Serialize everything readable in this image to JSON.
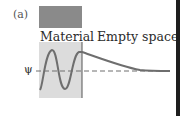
{
  "figure": {
    "panel_label": "(a)",
    "regions": [
      {
        "label": "Material",
        "fill": "#dcdcdc",
        "bar_fill": "#8a8a8a"
      },
      {
        "label": "Empty space",
        "fill": "#ffffff"
      }
    ],
    "axis_label": "ψ",
    "wave": {
      "inside": "oscillating sinusoid (~1.5 periods)",
      "outside": "exponential decay to axis",
      "color": "#6e6e6e"
    },
    "axis_style": "dashed",
    "colors": {
      "material_bar": "#8a8a8a",
      "material_region": "#dcdcdc",
      "curve": "#6e6e6e",
      "boundary": "#555555",
      "border": "#1e1e1e"
    }
  }
}
